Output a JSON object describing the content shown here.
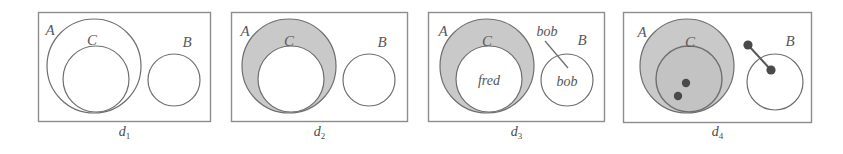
{
  "figure": {
    "type": "diagram",
    "kind": "euler-venn-set-diagram-sequence",
    "width": 843,
    "height": 154,
    "background": "#ffffff",
    "stroke_color": "#6b6b6b",
    "frame_color": "#8a8a8a",
    "shade_color": "#c9c9c9",
    "dot_color": "#4a4a4a",
    "label_color": "#595959"
  },
  "panels": [
    {
      "id": "d1",
      "caption_base": "d",
      "caption_sub": "1",
      "caption": "d1",
      "frame": {
        "x": 38,
        "y": 12,
        "w": 173,
        "h": 110
      },
      "sets": [
        {
          "name": "A",
          "label": "A",
          "shape": "circle",
          "cx": 94,
          "cy": 66,
          "r": 47,
          "shaded": false,
          "label_x": 50,
          "label_y": 35
        },
        {
          "name": "C",
          "label": "C",
          "shape": "circle",
          "cx": 96,
          "cy": 79,
          "r": 33,
          "shaded": false,
          "label_x": 92,
          "label_y": 44
        },
        {
          "name": "B",
          "label": "B",
          "shape": "circle",
          "cx": 174,
          "cy": 80,
          "r": 26,
          "shaded": false,
          "label_x": 186,
          "label_y": 47
        }
      ],
      "elements": [],
      "dots": [],
      "links": []
    },
    {
      "id": "d2",
      "caption_base": "d",
      "caption_sub": "2",
      "caption": "d2",
      "frame": {
        "x": 231,
        "y": 12,
        "w": 177,
        "h": 110
      },
      "sets": [
        {
          "name": "A",
          "label": "A",
          "shape": "circle",
          "cx": 289,
          "cy": 66,
          "r": 47,
          "shaded": true,
          "label_x": 245,
          "label_y": 36
        },
        {
          "name": "C",
          "label": "C",
          "shape": "circle",
          "cx": 291,
          "cy": 79,
          "r": 33,
          "shaded": false,
          "label_x": 288,
          "label_y": 45
        },
        {
          "name": "B",
          "label": "B",
          "shape": "circle",
          "cx": 369,
          "cy": 80,
          "r": 26,
          "shaded": false,
          "label_x": 381,
          "label_y": 47
        }
      ],
      "elements": [],
      "dots": [],
      "links": []
    },
    {
      "id": "d3",
      "caption_base": "d",
      "caption_sub": "3",
      "caption": "d3",
      "frame": {
        "x": 428,
        "y": 12,
        "w": 177,
        "h": 110
      },
      "sets": [
        {
          "name": "A",
          "label": "A",
          "shape": "circle",
          "cx": 487,
          "cy": 66,
          "r": 47,
          "shaded": true,
          "label_x": 443,
          "label_y": 36
        },
        {
          "name": "C",
          "label": "C",
          "shape": "circle",
          "cx": 489,
          "cy": 79,
          "r": 33,
          "shaded": false,
          "label_x": 486,
          "label_y": 45
        },
        {
          "name": "B",
          "label": "B",
          "shape": "circle",
          "cx": 567,
          "cy": 80,
          "r": 26,
          "shaded": false,
          "label_x": 580,
          "label_y": 45
        }
      ],
      "elements": [
        {
          "text": "fred",
          "in_set": "C",
          "x": 489,
          "y": 85
        },
        {
          "text": "bob",
          "in_set": "B",
          "x": 567,
          "y": 86
        }
      ],
      "annotations": [
        {
          "text": "bob",
          "x": 546,
          "y": 35,
          "leader": {
            "x1": 545,
            "y1": 41,
            "x2": 567,
            "y2": 67
          }
        }
      ],
      "dots": [],
      "links": []
    },
    {
      "id": "d4",
      "caption_base": "d",
      "caption_sub": "4",
      "caption": "d4",
      "frame": {
        "x": 623,
        "y": 12,
        "w": 189,
        "h": 111
      },
      "sets": [
        {
          "name": "A",
          "label": "A",
          "shape": "circle",
          "cx": 687,
          "cy": 66,
          "r": 47,
          "shaded": true,
          "label_x": 642,
          "label_y": 37
        },
        {
          "name": "C",
          "label": "C",
          "shape": "circle",
          "cx": 689,
          "cy": 79,
          "r": 33,
          "shaded": true,
          "label_x": 690,
          "label_y": 46
        },
        {
          "name": "B",
          "label": "B",
          "shape": "circle",
          "cx": 775,
          "cy": 82,
          "r": 28,
          "shaded": false,
          "label_x": 788,
          "label_y": 46
        }
      ],
      "elements": [],
      "dots": [
        {
          "id": "dot-c-1",
          "cx": 686,
          "cy": 83,
          "r": 4.2,
          "in_set": "C"
        },
        {
          "id": "dot-c-2",
          "cx": 678,
          "cy": 96,
          "r": 4.2,
          "in_set": "C"
        },
        {
          "id": "dot-b-outside",
          "cx": 748,
          "cy": 45,
          "r": 4.5,
          "in_set": null
        },
        {
          "id": "dot-b-inside",
          "cx": 771,
          "cy": 70,
          "r": 4.5,
          "in_set": "B"
        }
      ],
      "links": [
        {
          "from": "dot-b-outside",
          "to": "dot-b-inside",
          "x1": 748,
          "y1": 45,
          "x2": 771,
          "y2": 70
        }
      ]
    }
  ]
}
